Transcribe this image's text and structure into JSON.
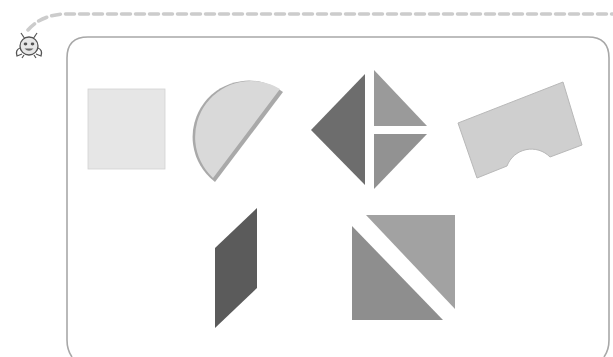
{
  "page": {
    "description": "Worksheet illustration showing wooden shape blocks inside a rounded frame"
  },
  "colors": {
    "background": "#ffffff",
    "frame_border": "#a8a8a8",
    "dashed_line": "#cccccc",
    "square": "#e6e6e6",
    "semicircle": "#d9d9d9",
    "semicircle_edge": "#a9a9a9",
    "diamond_left": "#6d6d6d",
    "diamond_upper_right": "#9a9a9a",
    "diamond_lower_right": "#929292",
    "arch_block": "#cfcfcf",
    "parallelogram": "#5b5b5b",
    "big_triangle_lower": "#8e8e8e",
    "big_triangle_upper": "#a2a2a2",
    "mascot": "#555555"
  },
  "mascot": {
    "label": "bug mascot icon"
  },
  "shapes": [
    {
      "name": "square",
      "label": "light square block"
    },
    {
      "name": "semicircle",
      "label": "semicircle block"
    },
    {
      "name": "diamond",
      "label": "diamond made of three triangles"
    },
    {
      "name": "arch",
      "label": "rectangular block with arch cutout"
    },
    {
      "name": "parallelogram",
      "label": "dark parallelogram"
    },
    {
      "name": "square-of-triangles",
      "label": "square made of two triangles"
    }
  ]
}
